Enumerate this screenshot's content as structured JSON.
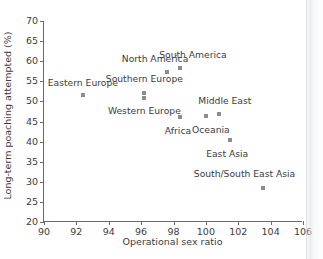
{
  "chart_data": {
    "type": "scatter",
    "title": "",
    "xlabel": "Operational sex ratio",
    "ylabel": "Long-term poaching attempted (%)",
    "xlim": [
      90,
      106
    ],
    "ylim": [
      20,
      70
    ],
    "xticks": [
      90,
      92,
      94,
      96,
      98,
      100,
      102,
      104,
      106
    ],
    "yticks": [
      20,
      25,
      30,
      35,
      40,
      45,
      50,
      55,
      60,
      65,
      70
    ],
    "grid": false,
    "legend": "none",
    "marker_color": "#8d8d8d",
    "axis_color": "#6b6b6b",
    "points": [
      {
        "label": "Eastern Europe",
        "x": 92.4,
        "y": 51.5,
        "label_dx": 0,
        "label_dy": -12
      },
      {
        "label": "Southern Europe",
        "x": 96.2,
        "y": 52.2,
        "label_dx": 0,
        "label_dy": -14
      },
      {
        "label": "Western Europe",
        "x": 96.2,
        "y": 50.8,
        "label_dx": 0,
        "label_dy": 13
      },
      {
        "label": "North America",
        "x": 97.6,
        "y": 57.4,
        "label_dx": -12,
        "label_dy": -13
      },
      {
        "label": "South America",
        "x": 98.4,
        "y": 58.4,
        "label_dx": 13,
        "label_dy": -13
      },
      {
        "label": "Africa",
        "x": 98.4,
        "y": 46.2,
        "label_dx": -2,
        "label_dy": 14
      },
      {
        "label": "Oceania",
        "x": 100.0,
        "y": 46.3,
        "label_dx": 5,
        "label_dy": 14
      },
      {
        "label": "Middle East",
        "x": 100.8,
        "y": 46.8,
        "label_dx": 6,
        "label_dy": -13
      },
      {
        "label": "East Asia",
        "x": 101.5,
        "y": 40.5,
        "label_dx": -3,
        "label_dy": 14
      },
      {
        "label": "South/South East Asia",
        "x": 103.5,
        "y": 28.4,
        "label_dx": -18,
        "label_dy": -14
      }
    ]
  }
}
